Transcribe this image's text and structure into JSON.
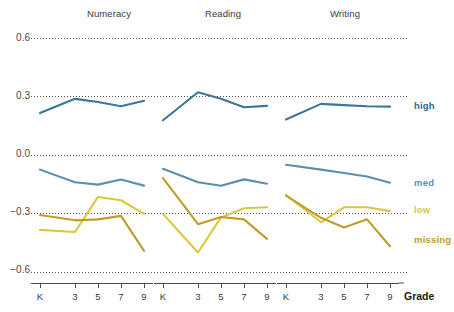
{
  "chart_data": {
    "type": "line",
    "title": "",
    "xlabel": "Grade",
    "ylabel": "",
    "ylim": [
      -0.7,
      0.68
    ],
    "yticks": [
      0.6,
      0.3,
      0.0,
      -0.3,
      -0.6
    ],
    "ytick_labels": [
      "0.6",
      "0.3",
      "0.0",
      "−0.3",
      "−0.6"
    ],
    "categories": [
      "K",
      "3",
      "5",
      "7",
      "9"
    ],
    "grid": "horizontal-dotted",
    "legend": "right-inline-series-labels",
    "facets": [
      {
        "name": "Numeracy",
        "series": [
          {
            "name": "high",
            "color": "#3a7798",
            "values": [
              0.215,
              0.288,
              0.272,
              0.25,
              0.278
            ]
          },
          {
            "name": "med",
            "color": "#5b8fad",
            "values": [
              -0.075,
              -0.14,
              -0.152,
              -0.126,
              -0.157
            ]
          },
          {
            "name": "low",
            "color": "#d8c93f",
            "values": [
              -0.384,
              -0.395,
              -0.215,
              -0.232,
              -0.302
            ]
          },
          {
            "name": "missing",
            "color": "#c19b2a",
            "values": [
              -0.308,
              -0.335,
              -0.33,
              -0.312,
              -0.492
            ]
          }
        ]
      },
      {
        "name": "Reading",
        "series": [
          {
            "name": "high",
            "color": "#3a7798",
            "values": [
              0.178,
              0.322,
              0.288,
              0.245,
              0.252
            ]
          },
          {
            "name": "med",
            "color": "#5b8fad",
            "values": [
              -0.071,
              -0.14,
              -0.158,
              -0.125,
              -0.147
            ]
          },
          {
            "name": "low",
            "color": "#d8c93f",
            "values": [
              -0.302,
              -0.5,
              -0.32,
              -0.273,
              -0.268
            ]
          },
          {
            "name": "missing",
            "color": "#c19b2a",
            "values": [
              -0.118,
              -0.355,
              -0.318,
              -0.33,
              -0.43
            ]
          }
        ]
      },
      {
        "name": "Writing",
        "series": [
          {
            "name": "high",
            "color": "#3a7798",
            "values": [
              0.182,
              0.262,
              0.256,
              0.25,
              0.248
            ]
          },
          {
            "name": "med",
            "color": "#5b8fad",
            "values": [
              -0.05,
              -0.075,
              -0.092,
              -0.11,
              -0.142
            ]
          },
          {
            "name": "low",
            "color": "#d8c93f",
            "values": [
              -0.205,
              -0.345,
              -0.268,
              -0.268,
              -0.288
            ]
          },
          {
            "name": "missing",
            "color": "#c19b2a",
            "values": [
              -0.208,
              -0.322,
              -0.372,
              -0.33,
              -0.468
            ]
          }
        ]
      }
    ],
    "series_labels": [
      {
        "name": "high",
        "color": "#2f6b8e",
        "label": "high"
      },
      {
        "name": "med",
        "color": "#5b8fad",
        "label": "med"
      },
      {
        "name": "low",
        "color": "#d8c93f",
        "label": "low"
      },
      {
        "name": "missing",
        "color": "#c19b2a",
        "label": "missing"
      }
    ]
  },
  "axis": {
    "x_title": "Grade"
  }
}
